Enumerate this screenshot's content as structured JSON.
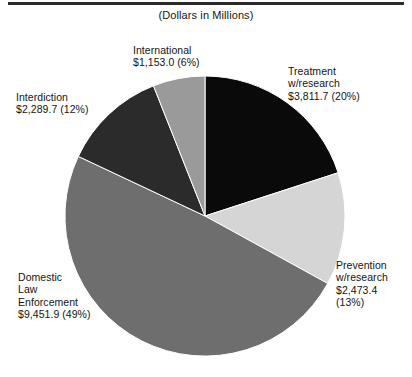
{
  "chart_data": {
    "type": "pie",
    "title": "",
    "subtitle": "(Dollars in Millions)",
    "units": "Dollars in Millions",
    "legend_position": "outside-labels",
    "grid": false,
    "total": 19179.7,
    "categories": [
      "Treatment w/research",
      "Prevention w/research",
      "Domestic Law Enforcement",
      "Interdiction",
      "International"
    ],
    "values": [
      3811.7,
      2473.4,
      9451.9,
      2289.7,
      1153.0
    ],
    "percentages": [
      20,
      13,
      49,
      12,
      6
    ],
    "colors": [
      "#0a0a0a",
      "#d5d5d5",
      "#6e6e6e",
      "#2b2b2b",
      "#9a9a9a"
    ],
    "start_angle_deg": 0,
    "direction": "clockwise",
    "slices": [
      {
        "name": "Treatment w/research",
        "value": 3811.7,
        "value_text": "$3,811.7",
        "percent": 20,
        "percent_text": "(20%)",
        "color": "#0a0a0a",
        "label_lines": [
          "Treatment",
          "w/research",
          "$3,811.7 (20%)"
        ]
      },
      {
        "name": "Prevention w/research",
        "value": 2473.4,
        "value_text": "$2,473.4",
        "percent": 13,
        "percent_text": "(13%)",
        "color": "#d5d5d5",
        "label_lines": [
          "Prevention",
          "w/research",
          "$2,473.4",
          "(13%)"
        ]
      },
      {
        "name": "Domestic Law Enforcement",
        "value": 9451.9,
        "value_text": "$9,451.9",
        "percent": 49,
        "percent_text": "(49%)",
        "color": "#6e6e6e",
        "label_lines": [
          "Domestic",
          "Law",
          "Enforcement",
          "$9,451.9 (49%)"
        ]
      },
      {
        "name": "Interdiction",
        "value": 2289.7,
        "value_text": "$2,289.7",
        "percent": 12,
        "percent_text": "(12%)",
        "color": "#2b2b2b",
        "label_lines": [
          "Interdiction",
          "$2,289.7 (12%)"
        ]
      },
      {
        "name": "International",
        "value": 1153.0,
        "value_text": "$1,153.0",
        "percent": 6,
        "percent_text": "(6%)",
        "color": "#9a9a9a",
        "label_lines": [
          "International",
          "$1,153.0 (6%)"
        ]
      }
    ]
  },
  "labels": {
    "subtitle": "(Dollars in Millions)",
    "treatment": "Treatment\nw/research\n$3,811.7 (20%)",
    "prevention": "Prevention\nw/research\n$2,473.4\n(13%)",
    "domestic": "Domestic\nLaw\nEnforcement\n$9,451.9 (49%)",
    "interdiction": "Interdiction\n$2,289.7 (12%)",
    "international": "International\n$1,153.0 (6%)"
  }
}
